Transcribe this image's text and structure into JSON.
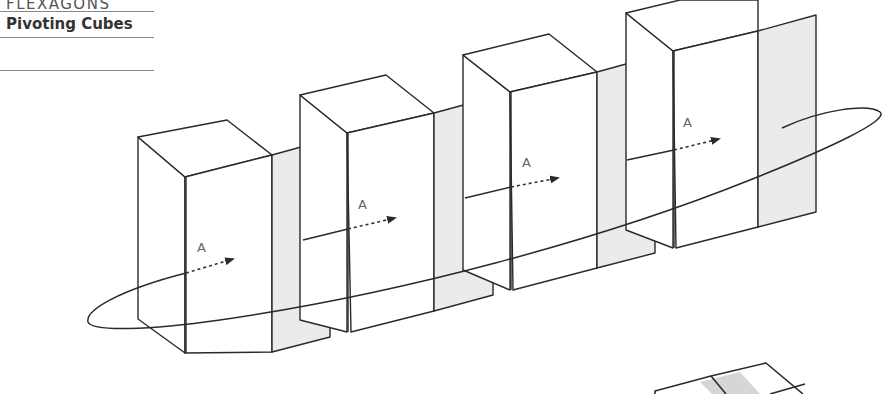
{
  "header": {
    "section": "FLEXAGONS",
    "title": "Pivoting Cubes"
  },
  "figure": {
    "arrow_label": "A",
    "colors": {
      "stroke": "#2a2a2a",
      "panel_fill": "#ebebeb",
      "box_fill": "#ffffff",
      "label": "#666666"
    },
    "boxes": [
      {
        "id": 1,
        "label": "A"
      },
      {
        "id": 2,
        "label": "A"
      },
      {
        "id": 3,
        "label": "A"
      },
      {
        "id": 4,
        "label": "A"
      }
    ],
    "partial_figure_bottom_right": "flattened cube net (cut off)"
  }
}
